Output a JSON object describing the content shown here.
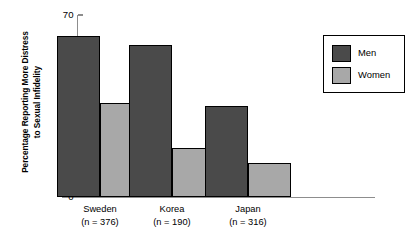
{
  "chart_data": {
    "type": "bar",
    "title": "",
    "xlabel": "",
    "ylabel": "Percentage Reporting More Distress\nto Sexual Infidelity",
    "ylim": [
      0,
      70
    ],
    "ytick_labels": [
      "70",
      "60",
      "50",
      "40",
      "30",
      "20",
      "10",
      "0"
    ],
    "ytick_values": [
      70,
      60,
      50,
      40,
      30,
      20,
      10,
      0
    ],
    "grid": false,
    "legend_position": "top-right-inside",
    "categories": [
      "Sweden",
      "Korea",
      "Japan"
    ],
    "category_sublabels": [
      "(n = 376)",
      "(n = 190)",
      "(n = 316)"
    ],
    "series": [
      {
        "name": "Men",
        "color": "#4a4a4a",
        "values": [
          62,
          58.5,
          35
        ]
      },
      {
        "name": "Women",
        "color": "#a8a8a8",
        "values": [
          36,
          19,
          13
        ]
      }
    ]
  },
  "legend": {
    "entries": [
      {
        "label": "Men"
      },
      {
        "label": "Women"
      }
    ]
  }
}
